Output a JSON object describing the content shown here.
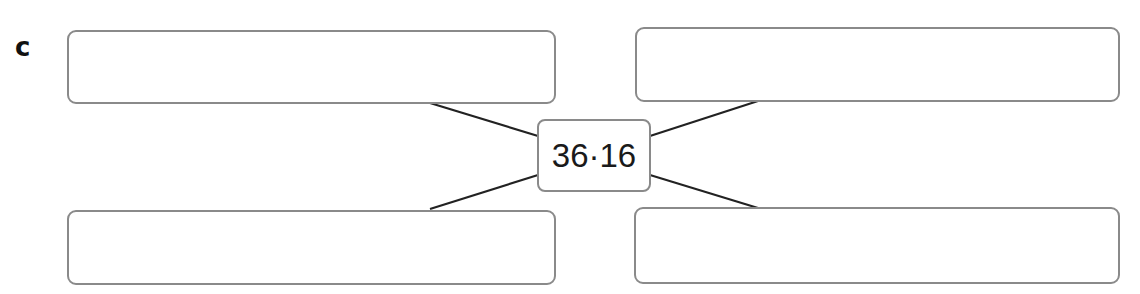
{
  "label": "c",
  "center": {
    "value": "36·16"
  },
  "boxes": [
    {
      "position": "top-left",
      "value": ""
    },
    {
      "position": "top-right",
      "value": ""
    },
    {
      "position": "bottom-left",
      "value": ""
    },
    {
      "position": "bottom-right",
      "value": ""
    }
  ],
  "colors": {
    "box_border": "#8a8a8a",
    "connector": "#222222",
    "text": "#1a1a1a"
  }
}
